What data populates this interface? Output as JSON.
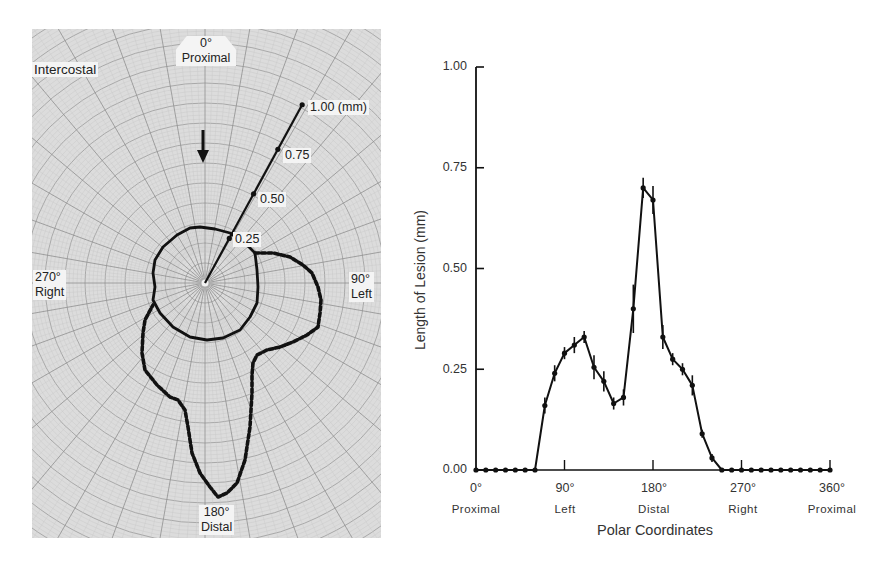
{
  "polar_figure": {
    "labels": {
      "intercostal": "Intercostal",
      "top_deg": "0°",
      "top_name": "Proximal",
      "right_deg": "90°",
      "right_name": "Left",
      "bottom_deg": "180°",
      "bottom_name": "Distal",
      "left_deg": "270°",
      "left_name": "Right"
    },
    "scale_ticks": [
      {
        "value": 0.25,
        "label": "0.25"
      },
      {
        "value": 0.5,
        "label": "0.50"
      },
      {
        "value": 0.75,
        "label": "0.75"
      },
      {
        "value": 1.0,
        "label": "1.00 (mm)"
      }
    ]
  },
  "chart_data": [
    {
      "type": "polar",
      "title": "",
      "center_px": [
        205,
        283
      ],
      "radius_px_per_mm": 203,
      "scale_axis_angle_deg": 28.6,
      "annotations": [
        "Intercostal",
        "0° Proximal",
        "90° Left",
        "180° Distal",
        "270° Right",
        "1.00 (mm)",
        "0.75",
        "0.50",
        "0.25"
      ],
      "series": [
        {
          "name": "inner contour (solid)",
          "style": "solid",
          "points_px": [
            [
              255,
              253
            ],
            [
              257,
              270
            ],
            [
              258,
              287
            ],
            [
              257,
              303
            ],
            [
              250,
              317
            ],
            [
              240,
              330
            ],
            [
              223,
              338
            ],
            [
              207,
              340
            ],
            [
              190,
              337
            ],
            [
              173,
              327
            ],
            [
              160,
              313
            ],
            [
              153,
              300
            ],
            [
              155,
              287
            ],
            [
              153,
              273
            ],
            [
              155,
              260
            ],
            [
              163,
              247
            ],
            [
              177,
              235
            ],
            [
              190,
              228
            ],
            [
              200,
              227
            ],
            [
              215,
              229
            ],
            [
              230,
              233
            ],
            [
              245,
              243
            ],
            [
              255,
              253
            ]
          ]
        },
        {
          "name": "outer contour (dashed)",
          "style": "dashed",
          "points_px": [
            [
              255,
              253
            ],
            [
              273,
              253
            ],
            [
              290,
              257
            ],
            [
              303,
              265
            ],
            [
              312,
              273
            ],
            [
              318,
              287
            ],
            [
              321,
              300
            ],
            [
              320,
              313
            ],
            [
              318,
              327
            ],
            [
              307,
              335
            ],
            [
              293,
              342
            ],
            [
              280,
              347
            ],
            [
              267,
              350
            ],
            [
              257,
              355
            ],
            [
              253,
              363
            ],
            [
              252,
              375
            ],
            [
              252,
              393
            ],
            [
              250,
              427
            ],
            [
              245,
              460
            ],
            [
              237,
              483
            ],
            [
              227,
              493
            ],
            [
              218,
              497
            ],
            [
              210,
              487
            ],
            [
              200,
              473
            ],
            [
              192,
              453
            ],
            [
              188,
              427
            ],
            [
              185,
              410
            ],
            [
              178,
              400
            ],
            [
              170,
              397
            ],
            [
              157,
              385
            ],
            [
              145,
              370
            ],
            [
              142,
              353
            ],
            [
              143,
              333
            ],
            [
              145,
              320
            ],
            [
              153,
              305
            ]
          ]
        }
      ]
    },
    {
      "type": "line",
      "title": "",
      "xlabel": "Polar Coordinates",
      "ylabel": "Length of Lesion (mm)",
      "xlim": [
        0,
        360
      ],
      "ylim": [
        0,
        1.0
      ],
      "grid": false,
      "x_ticks": [
        {
          "value": 0,
          "label": "0°",
          "name": "Proximal"
        },
        {
          "value": 90,
          "label": "90°",
          "name": "Left"
        },
        {
          "value": 180,
          "label": "180°",
          "name": "Distal"
        },
        {
          "value": 270,
          "label": "270°",
          "name": "Right"
        },
        {
          "value": 360,
          "label": "360°",
          "name": "Proximal"
        }
      ],
      "y_ticks": [
        "0.00",
        "0.25",
        "0.50",
        "0.75",
        "1.00"
      ],
      "series": [
        {
          "name": "Length of Lesion",
          "x": [
            0,
            10,
            20,
            30,
            40,
            50,
            60,
            70,
            80,
            90,
            100,
            110,
            120,
            130,
            140,
            150,
            160,
            170,
            180,
            190,
            200,
            210,
            220,
            230,
            240,
            250,
            260,
            270,
            280,
            290,
            300,
            310,
            320,
            330,
            340,
            350,
            360
          ],
          "y": [
            0,
            0,
            0,
            0,
            0,
            0,
            0,
            0.16,
            0.24,
            0.29,
            0.31,
            0.33,
            0.255,
            0.22,
            0.165,
            0.18,
            0.4,
            0.7,
            0.67,
            0.33,
            0.275,
            0.25,
            0.21,
            0.09,
            0.03,
            0,
            0,
            0,
            0,
            0,
            0,
            0,
            0,
            0,
            0,
            0,
            0
          ],
          "error_bar_halfwidth": [
            0,
            0,
            0,
            0,
            0,
            0,
            0,
            0.02,
            0.02,
            0.015,
            0.02,
            0.015,
            0.03,
            0.025,
            0.015,
            0.02,
            0.06,
            0.025,
            0.035,
            0.03,
            0.015,
            0.015,
            0.025,
            0.01,
            0.01,
            0,
            0,
            0,
            0,
            0,
            0,
            0,
            0,
            0,
            0,
            0,
            0
          ]
        }
      ]
    }
  ]
}
